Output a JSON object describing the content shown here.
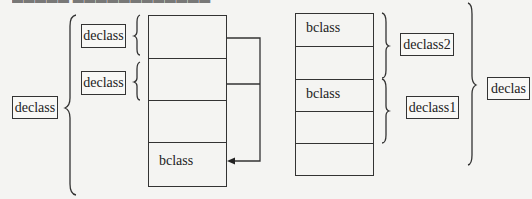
{
  "diagram": {
    "left_group": {
      "outer_label": "declass",
      "inner_labels": [
        "declass",
        "declass"
      ],
      "table": {
        "rows": [
          "",
          "",
          "",
          "bclass",
          ""
        ]
      }
    },
    "right_group": {
      "table": {
        "rows": [
          "bclass",
          "",
          "bclass",
          "",
          ""
        ]
      },
      "inner_labels": [
        "declass2",
        "declass1"
      ],
      "outer_label": "declas"
    }
  }
}
